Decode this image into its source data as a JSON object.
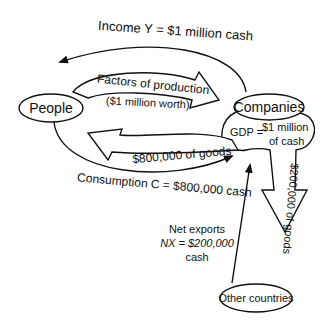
{
  "diagram": {
    "nodes": {
      "people": "People",
      "companies": "Companies",
      "other_countries": "Other countries"
    },
    "flows": {
      "income": "Income Y = $1 million cash",
      "factors_line1": "Factors of production",
      "factors_line2": "($1 million worth)",
      "goods_800": "$800,000 of goods",
      "consumption": "Consumption C = $800,000 cash",
      "gdp_label": "GDP =",
      "gdp_value_line1": "$1 million",
      "gdp_value_line2": "of cash",
      "goods_200": "$200,000 of goods",
      "net_exports_line1": "Net exports",
      "net_exports_line2": "NX = $200,000",
      "net_exports_line3": "cash"
    }
  }
}
